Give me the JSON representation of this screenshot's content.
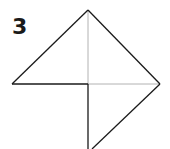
{
  "step": {
    "number": "3"
  },
  "diagram": {
    "colors": {
      "line": "#1a1a1a",
      "crease": "#9a9a9a",
      "background": "#ffffff"
    }
  }
}
